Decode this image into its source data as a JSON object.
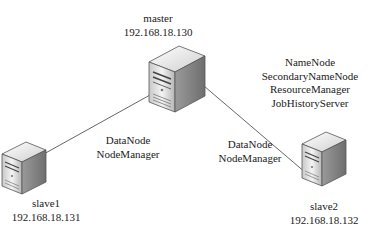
{
  "nodes": {
    "master": {
      "name": "master",
      "ip": "192.168.18.130",
      "roles": [
        "NameNode",
        "SecondaryNameNode",
        "ResourceManager",
        "JobHistoryServer"
      ]
    },
    "slave1": {
      "name": "slave1",
      "ip": "192.168.18.131",
      "roles": [
        "DataNode",
        "NodeManager"
      ]
    },
    "slave2": {
      "name": "slave2",
      "ip": "192.168.18.132",
      "roles": [
        "DataNode",
        "NodeManager"
      ]
    }
  },
  "edges": [
    {
      "from": "master",
      "to": "slave1"
    },
    {
      "from": "master",
      "to": "slave2"
    }
  ],
  "colors": {
    "line": "#555555",
    "text": "#222222",
    "server_light": "#f2f2f2",
    "server_dark": "#8a8a8a"
  }
}
